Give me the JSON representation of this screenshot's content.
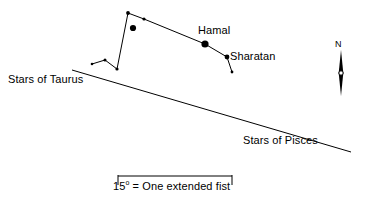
{
  "figure": {
    "type": "star-chart",
    "title": "",
    "background_color": "#ffffff",
    "ink_color": "#000000",
    "width": 367,
    "height": 206
  },
  "labels": {
    "hamal": "Hamal",
    "sharatan": "Sharatan",
    "stars_of_taurus": "Stars of Taurus",
    "stars_of_pisces": "Stars of Pisces",
    "north": "N"
  },
  "scale_bar": {
    "value": "15",
    "degree_symbol": "o",
    "caption_rest": " = One extended fist",
    "full_text": "15o = One extended fist",
    "x_start": 118,
    "x_end": 232,
    "y": 176,
    "tick_height": 9
  },
  "compass": {
    "name": "north-arrow",
    "label": "N",
    "x": 341,
    "y_top": 50,
    "y_bottom": 96,
    "hub_y": 73,
    "hub_radius": 2.2
  },
  "ecliptic": {
    "name": "ecliptic-line",
    "x1": 72,
    "y1": 70,
    "x2": 351,
    "y2": 152
  },
  "chart_data": {
    "type": "scatter",
    "xlabel": "",
    "ylabel": "",
    "xlim": [
      0,
      367
    ],
    "ylim": [
      206,
      0
    ],
    "grid": false,
    "legend": "none",
    "annotations": [
      {
        "text": "Hamal",
        "x": 198,
        "y": 24
      },
      {
        "text": "Sharatan",
        "x": 230,
        "y": 50
      },
      {
        "text": "Stars of Taurus",
        "x": 8,
        "y": 73
      },
      {
        "text": "Stars of Pisces",
        "x": 243,
        "y": 134
      },
      {
        "text": "N",
        "x": 335,
        "y": 39
      },
      {
        "text": "15o = One extended fist",
        "x": 113,
        "y": 180
      }
    ],
    "series": [
      {
        "name": "stars",
        "points": [
          {
            "id": "star-apex",
            "x": 128,
            "y": 13,
            "r": 1.9,
            "label": ""
          },
          {
            "id": "star-upper-right",
            "x": 144,
            "y": 19,
            "r": 1.6,
            "label": ""
          },
          {
            "id": "star-bright-inner",
            "x": 133,
            "y": 28,
            "r": 3.1,
            "label": ""
          },
          {
            "id": "star-hamal",
            "x": 205,
            "y": 44,
            "r": 3.6,
            "label": "Hamal"
          },
          {
            "id": "star-sharatan",
            "x": 227,
            "y": 57,
            "r": 2.4,
            "label": "Sharatan"
          },
          {
            "id": "star-mesarthim",
            "x": 232,
            "y": 72,
            "r": 1.4,
            "label": ""
          },
          {
            "id": "star-lower-bend",
            "x": 117,
            "y": 69,
            "r": 1.6,
            "label": ""
          },
          {
            "id": "star-left-peak",
            "x": 105,
            "y": 60,
            "r": 1.5,
            "label": ""
          },
          {
            "id": "star-left-tail",
            "x": 92,
            "y": 64,
            "r": 1.3,
            "label": ""
          }
        ]
      }
    ],
    "lines": [
      {
        "name": "aries-asterism",
        "points": [
          [
            92,
            64
          ],
          [
            105,
            60
          ],
          [
            117,
            69
          ],
          [
            128,
            13
          ],
          [
            144,
            19
          ],
          [
            205,
            44
          ],
          [
            227,
            57
          ],
          [
            232,
            72
          ]
        ]
      },
      {
        "name": "ecliptic",
        "points": [
          [
            72,
            70
          ],
          [
            351,
            152
          ]
        ]
      }
    ]
  }
}
